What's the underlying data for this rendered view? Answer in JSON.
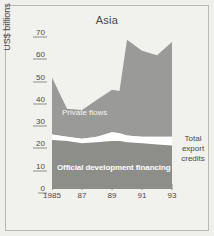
{
  "chart_data": {
    "type": "area",
    "title": "Asia",
    "xlabel": "",
    "ylabel": "US$ billions",
    "stacked": true,
    "grid": false,
    "legend_position": "in-plot",
    "xlim": [
      1985,
      1993
    ],
    "ylim": [
      0,
      70
    ],
    "yticks": [
      0,
      10,
      20,
      30,
      40,
      50,
      60,
      70
    ],
    "xticks": [
      1985,
      1987,
      1989,
      1991,
      1993
    ],
    "xticklabels": [
      "1985",
      "87",
      "89",
      "91",
      "93"
    ],
    "x": [
      1985,
      1986,
      1987,
      1988,
      1989,
      1989.5,
      1990,
      1991,
      1992,
      1993
    ],
    "series": [
      {
        "name": "Official development financing",
        "color": "#8d8d8a",
        "values": [
          22.0,
          21.5,
          20.5,
          21.0,
          21.5,
          21.5,
          21.0,
          20.5,
          20.0,
          19.5
        ]
      },
      {
        "name": "Total export credits",
        "color": "#ffffff",
        "values": [
          2.5,
          2.0,
          2.0,
          2.5,
          4.0,
          3.5,
          3.0,
          3.0,
          3.5,
          4.0
        ]
      },
      {
        "name": "Private flows",
        "color": "#9a9a98",
        "values": [
          25.5,
          12.5,
          13.0,
          16.5,
          19.0,
          19.0,
          43.0,
          38.5,
          36.5,
          42.5
        ]
      }
    ],
    "cumulative_top": [
      50.0,
      36.0,
      35.5,
      40.0,
      44.5,
      44.0,
      67.0,
      62.0,
      60.0,
      66.0
    ],
    "annotations": [
      {
        "text": "Private flows",
        "series": "Private flows"
      },
      {
        "text": "Official development financing",
        "series": "Official development financing"
      },
      {
        "text": "Total export credits",
        "series": "Total export credits"
      }
    ]
  },
  "labels": {
    "private_flows": "Private flows",
    "official_development_financing": "Official development financing",
    "total_export_credits_line1": "Total",
    "total_export_credits_line2": "export",
    "total_export_credits_line3": "credits"
  },
  "colors": {
    "background": "#efefec",
    "panel": "#f1f1ee",
    "border": "#b9b9b4",
    "private_flows": "#9a9a98",
    "official_development_financing": "#8d8d8a",
    "export_credits": "#ffffff",
    "text": "#4a4a4a"
  }
}
